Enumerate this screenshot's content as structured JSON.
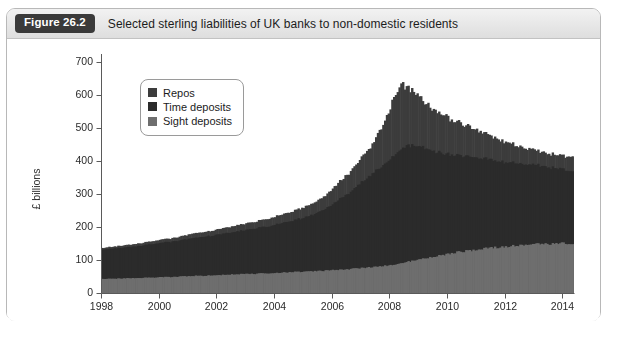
{
  "figure": {
    "badge": "Figure 26.2",
    "title": "Selected sterling liabilities of UK banks to non-domestic residents",
    "source_caption": ""
  },
  "legend": {
    "items": [
      {
        "label": "Repos",
        "color": "#3c3c3c"
      },
      {
        "label": "Time deposits",
        "color": "#2b2b2b"
      },
      {
        "label": "Sight deposits",
        "color": "#6e6e6e"
      }
    ]
  },
  "colors": {
    "panel_border": "#b8b8b8",
    "header_bg": "#e7e7e7",
    "badge_bg": "#3a3a3a",
    "badge_text": "#ffffff",
    "axis": "#5a5a5a",
    "plot_bg": "#ffffff",
    "repos": "#3c3c3c",
    "time_deposits": "#2b2b2b",
    "sight_deposits": "#6e6e6e"
  },
  "chart_data": {
    "type": "area",
    "stacked": true,
    "title": "Selected sterling liabilities of UK banks to non-domestic residents",
    "xlabel": "",
    "ylabel": "£ billions",
    "xlim": [
      1998.0,
      2014.4
    ],
    "ylim": [
      0,
      700
    ],
    "yticks": [
      0,
      100,
      200,
      300,
      400,
      500,
      600,
      700
    ],
    "ytick_labels": [
      "0",
      "100",
      "200",
      "300",
      "400",
      "500",
      "600",
      "700"
    ],
    "xticks": [
      1998,
      2000,
      2002,
      2004,
      2006,
      2008,
      2010,
      2012,
      2014
    ],
    "xtick_labels": [
      "1998",
      "2000",
      "2002",
      "2004",
      "2006",
      "2008",
      "2010",
      "2012",
      "2014"
    ],
    "grid": false,
    "legend_position": "upper-left-inside",
    "x": [
      1998.0,
      1998.25,
      1998.5,
      1998.75,
      1999.0,
      1999.25,
      1999.5,
      1999.75,
      2000.0,
      2000.25,
      2000.5,
      2000.75,
      2001.0,
      2001.25,
      2001.5,
      2001.75,
      2002.0,
      2002.25,
      2002.5,
      2002.75,
      2003.0,
      2003.25,
      2003.5,
      2003.75,
      2004.0,
      2004.25,
      2004.5,
      2004.75,
      2005.0,
      2005.25,
      2005.5,
      2005.75,
      2006.0,
      2006.25,
      2006.5,
      2006.75,
      2007.0,
      2007.25,
      2007.5,
      2007.75,
      2008.0,
      2008.25,
      2008.5,
      2008.75,
      2009.0,
      2009.25,
      2009.5,
      2009.75,
      2010.0,
      2010.25,
      2010.5,
      2010.75,
      2011.0,
      2011.25,
      2011.5,
      2011.75,
      2012.0,
      2012.25,
      2012.5,
      2012.75,
      2013.0,
      2013.25,
      2013.5,
      2013.75,
      2014.0,
      2014.25
    ],
    "series": [
      {
        "name": "Sight deposits",
        "color": "#6e6e6e",
        "values": [
          42,
          43,
          44,
          44,
          45,
          46,
          46,
          47,
          48,
          48,
          49,
          50,
          51,
          52,
          52,
          53,
          54,
          55,
          56,
          57,
          58,
          58,
          59,
          60,
          61,
          62,
          63,
          64,
          65,
          66,
          67,
          68,
          70,
          71,
          72,
          74,
          76,
          78,
          80,
          83,
          86,
          90,
          94,
          98,
          103,
          108,
          112,
          116,
          120,
          124,
          127,
          130,
          133,
          136,
          138,
          140,
          142,
          144,
          146,
          147,
          148,
          149,
          150,
          150,
          150,
          150
        ]
      },
      {
        "name": "Time deposits",
        "color": "#2b2b2b",
        "values": [
          88,
          90,
          92,
          93,
          95,
          97,
          99,
          101,
          104,
          106,
          108,
          110,
          113,
          116,
          118,
          120,
          123,
          126,
          128,
          131,
          134,
          137,
          140,
          143,
          147,
          151,
          155,
          160,
          165,
          172,
          180,
          190,
          204,
          218,
          232,
          248,
          266,
          282,
          296,
          310,
          330,
          345,
          352,
          348,
          338,
          326,
          316,
          306,
          300,
          294,
          288,
          282,
          276,
          270,
          264,
          258,
          254,
          250,
          246,
          242,
          238,
          234,
          230,
          226,
          222,
          218
        ]
      },
      {
        "name": "Repos",
        "color": "#3c3c3c",
        "values": [
          5,
          6,
          6,
          7,
          7,
          8,
          8,
          9,
          10,
          10,
          11,
          12,
          13,
          14,
          14,
          15,
          16,
          17,
          18,
          19,
          20,
          21,
          22,
          23,
          25,
          26,
          28,
          30,
          32,
          35,
          38,
          42,
          48,
          54,
          60,
          68,
          78,
          90,
          108,
          136,
          170,
          195,
          182,
          160,
          144,
          132,
          124,
          116,
          108,
          100,
          94,
          88,
          82,
          76,
          70,
          64,
          58,
          54,
          50,
          46,
          44,
          42,
          40,
          40,
          42,
          46
        ]
      }
    ],
    "annotations": {
      "start_total": 135,
      "peak_total": 632,
      "peak_year": 2008.25,
      "end_total": 414
    }
  }
}
